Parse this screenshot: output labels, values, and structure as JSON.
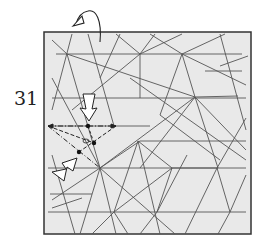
{
  "step": {
    "number": "31"
  },
  "paper": {
    "fill": "#e9e9e9",
    "stroke": "#333333"
  },
  "crease_color": "#555555",
  "annotations": {
    "turn_over_arrow": "turn-over",
    "push_arrows": [
      "push-down-arrow",
      "push-diagonal-arrow"
    ],
    "fold_lines": [
      "valley-fold",
      "mountain-fold"
    ]
  }
}
